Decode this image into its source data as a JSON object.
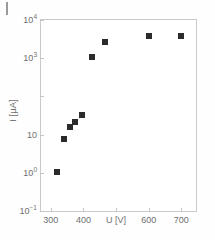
{
  "chart_data": {
    "type": "scatter",
    "title": "",
    "xlabel": "U [V]",
    "ylabel": "I [µA]",
    "xlim": [
      270,
      745
    ],
    "ylim": [
      0.1,
      10000
    ],
    "yscale": "log",
    "xscale": "linear",
    "grid": false,
    "legend": null,
    "x_tick_labels": [
      "300",
      "400",
      "U [V]",
      "600",
      "700"
    ],
    "x_tick_values": [
      300,
      400,
      500,
      600,
      700
    ],
    "x_axis_label_replaces_tick": "500",
    "y_tick_labels": [
      "10⁻¹",
      "10⁰",
      "10",
      "10³",
      "10⁴"
    ],
    "y_tick_values": [
      0.1,
      1,
      10,
      1000,
      10000
    ],
    "marker": "filled-square",
    "marker_color": "#2b2b2b",
    "x": [
      320,
      340,
      358,
      375,
      395,
      425,
      465,
      600,
      700
    ],
    "y": [
      1.05,
      7.5,
      16,
      21,
      33,
      1050,
      2600,
      3700,
      3800
    ],
    "points": [
      {
        "u_volts": 320,
        "i_microamps": 1.05
      },
      {
        "u_volts": 340,
        "i_microamps": 7.5
      },
      {
        "u_volts": 358,
        "i_microamps": 16
      },
      {
        "u_volts": 375,
        "i_microamps": 21
      },
      {
        "u_volts": 395,
        "i_microamps": 33
      },
      {
        "u_volts": 425,
        "i_microamps": 1050
      },
      {
        "u_volts": 465,
        "i_microamps": 2600
      },
      {
        "u_volts": 600,
        "i_microamps": 3700
      },
      {
        "u_volts": 700,
        "i_microamps": 3800
      }
    ]
  },
  "y_ticks": [
    {
      "label_main": "10",
      "label_sup": "4",
      "value": 10000
    },
    {
      "label_main": "10",
      "label_sup": "3",
      "value": 1000
    },
    {
      "label_main": "10",
      "label_sup": "",
      "value": 10
    },
    {
      "label_main": "10",
      "label_sup": "0",
      "value": 1
    },
    {
      "label_main": "10",
      "label_sup": "-1",
      "value": 0.1
    }
  ],
  "x_ticks": [
    {
      "label": "300",
      "value": 300
    },
    {
      "label": "400",
      "value": 400
    },
    {
      "label": "U [V]",
      "value": 500
    },
    {
      "label": "600",
      "value": 600
    },
    {
      "label": "700",
      "value": 700
    }
  ],
  "axis_titles": {
    "y": "I [µA]",
    "x": "U [V]"
  }
}
